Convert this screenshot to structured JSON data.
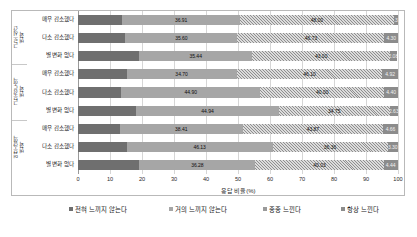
{
  "chart_data": {
    "type": "bar",
    "orientation": "horizontal",
    "stacked": true,
    "title": "",
    "xlabel": "응답 비율(%)",
    "ylabel": "",
    "xlim": [
      0,
      100
    ],
    "xticks": [
      0,
      10,
      20,
      30,
      40,
      50,
      60,
      70,
      80,
      90,
      100
    ],
    "grid": true,
    "legend_position": "bottom",
    "groups": [
      {
        "label": "근로시간\n변화",
        "categories": [
          "매우 감소했다",
          "다소 감소했다",
          "별 변화 없다"
        ]
      },
      {
        "label": "근무강도의\n변화",
        "categories": [
          "매우 감소했다",
          "다소 감소했다",
          "별 변화 없다"
        ]
      },
      {
        "label": "업무량의\n변화",
        "categories": [
          "매우 감소했다",
          "다소 감소했다",
          "별 변화 없다"
        ]
      }
    ],
    "categories": [
      "매우 감소했다",
      "다소 감소했다",
      "별 변화 없다",
      "매우 감소했다",
      "다소 감소했다",
      "별 변화 없다",
      "매우 감소했다",
      "다소 감소했다",
      "별 변화 없다"
    ],
    "series": [
      {
        "name": "전혀 느끼지 않는다",
        "color": "#6f6f6f",
        "values": [
          13.8,
          15.06,
          19.06,
          15.4,
          13.9,
          18.25,
          13.07,
          15.4,
          19.17
        ]
      },
      {
        "name": "거의 느끼지 않는다",
        "color": "#a6a6a6",
        "values": [
          36.91,
          35.6,
          35.44,
          34.7,
          44.9,
          44.94,
          38.41,
          46.13,
          36.28
        ]
      },
      {
        "name": "종종 느낀다",
        "color": "#9a9a9a",
        "values": [
          48.0,
          46.73,
          43.0,
          46.1,
          40.0,
          34.75,
          43.87,
          36.36,
          40.03
        ]
      },
      {
        "name": "항상 느낀다",
        "color": "#8c8c8c",
        "values": [
          1.37,
          4.3,
          2.08,
          4.92,
          4.4,
          2.63,
          4.66,
          3.3,
          4.44
        ]
      }
    ]
  },
  "xaxis": {
    "title": "응답 비율(%)"
  },
  "legend": {
    "items": [
      {
        "label": "전혀 느끼지 않는다"
      },
      {
        "label": "거의 느끼지 않는다"
      },
      {
        "label": "종종 느낀다"
      },
      {
        "label": "항상 느낀다"
      }
    ]
  }
}
